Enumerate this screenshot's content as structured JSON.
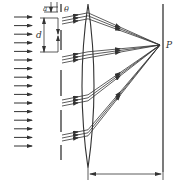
{
  "diagram": {
    "labels": {
      "slit_width": "a",
      "grating_period": "d",
      "angle": "θ",
      "focus_point": "P"
    },
    "colors": {
      "line": "#333333",
      "background": "#ffffff"
    },
    "incident_arrows": {
      "count": 16,
      "x_start": 14,
      "x_end": 32,
      "y_start": 17,
      "y_step": 8.6
    },
    "lens": {
      "x": 88,
      "top": 4,
      "bottom": 168
    },
    "focus": {
      "x": 160,
      "y": 45
    },
    "screen": {
      "x": 163,
      "top": 4,
      "bottom": 172
    },
    "dimension_arrow": {
      "y": 174,
      "x1": 88,
      "x2": 163
    }
  }
}
